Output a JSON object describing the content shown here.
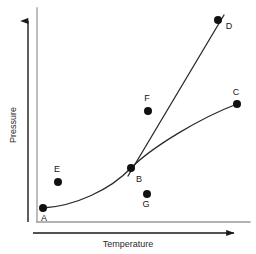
{
  "figure": {
    "type": "scatter-with-curves",
    "background_color": "#ffffff",
    "width": 256,
    "height": 254
  },
  "axes": {
    "x": {
      "label": "Temperature",
      "label_x": 128,
      "label_y": 247,
      "arrow_name": "x-axis-arrow",
      "arrow_start_x": 33,
      "arrow_end_x": 234,
      "arrow_y": 233,
      "color": "#1a1a1a"
    },
    "y": {
      "label": "Pressure",
      "label_x": 16,
      "label_y": 125,
      "arrow_name": "y-axis-arrow",
      "arrow_start_y": 222,
      "arrow_end_y": 21,
      "arrow_x": 28,
      "color": "#1a1a1a"
    }
  },
  "plot_frame": {
    "left": 37,
    "right": 250,
    "top": 8,
    "bottom": 222,
    "color": "#9a9a9a",
    "stroke_width": 1.3
  },
  "curves": [
    {
      "name": "lower-boundary-curve",
      "description": "curve through A, B to C",
      "path": "M 43 208 C 75 206, 110 190, 131 168 C 152 147, 200 118, 237 104",
      "color": "#2a2a2a",
      "stroke_width": 1.3
    },
    {
      "name": "upper-boundary-curve",
      "description": "steep line from B through D",
      "path": "M 128 176 L 224 15",
      "color": "#2a2a2a",
      "stroke_width": 1.3
    }
  ],
  "chart_data": {
    "type": "scatter",
    "title": "",
    "xlabel": "Temperature",
    "ylabel": "Pressure",
    "grid": false,
    "legend": null,
    "point_color": "#111111",
    "point_radius": 4,
    "points": [
      {
        "label": "A",
        "x": 43,
        "y": 208,
        "label_x": 44,
        "label_y": 221,
        "on_curve": true
      },
      {
        "label": "B",
        "x": 131,
        "y": 168,
        "label_x": 139,
        "label_y": 182,
        "on_curve": true
      },
      {
        "label": "C",
        "x": 237,
        "y": 104,
        "label_x": 236,
        "label_y": 95,
        "on_curve": true
      },
      {
        "label": "D",
        "x": 218,
        "y": 20,
        "label_x": 229,
        "label_y": 29,
        "on_curve": true
      },
      {
        "label": "E",
        "x": 58,
        "y": 182,
        "label_x": 57,
        "label_y": 172,
        "on_curve": false
      },
      {
        "label": "F",
        "x": 148,
        "y": 111,
        "label_x": 147,
        "label_y": 101,
        "on_curve": false
      },
      {
        "label": "G",
        "x": 147,
        "y": 194,
        "label_x": 146,
        "label_y": 207,
        "on_curve": false
      }
    ]
  }
}
